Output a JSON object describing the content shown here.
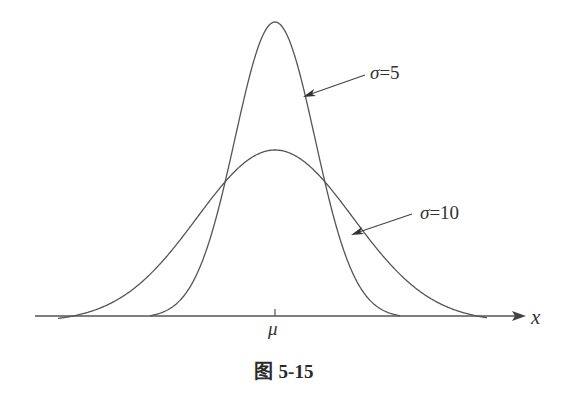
{
  "chart_data": {
    "type": "line",
    "xlabel": "x",
    "ylabel": "",
    "x_tick_labels": [
      "μ"
    ],
    "grid": false,
    "legend": "inline arrow annotations",
    "series": [
      {
        "name": "σ=5",
        "mean": "μ",
        "sigma": 5,
        "shape": "normal density, narrow and tall"
      },
      {
        "name": "σ=10",
        "mean": "μ",
        "sigma": 10,
        "shape": "normal density, wide and flat"
      }
    ],
    "annotations": [
      {
        "text": "σ=5",
        "points_to": "right flank of narrow curve"
      },
      {
        "text": "σ=10",
        "points_to": "right flank of wide curve"
      }
    ]
  },
  "labels": {
    "sigma5_symbol": "σ",
    "sigma5_value": "=5",
    "sigma10_symbol": "σ",
    "sigma10_value": "=10",
    "x_axis": "x",
    "mu": "μ",
    "caption_cn": "图",
    "caption_num": "5-15"
  },
  "colors": {
    "stroke": "#555555",
    "text": "#333333"
  }
}
